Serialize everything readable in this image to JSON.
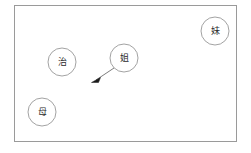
{
  "canvas": {
    "width": 251,
    "height": 153,
    "background_color": "#ffffff"
  },
  "frame": {
    "label": "diagram-frame",
    "x": 14,
    "y": 5,
    "width": 223,
    "height": 137,
    "stroke_color": "#9a9a9a",
    "fill_color": "#ffffff"
  },
  "nodes": [
    {
      "id": "node-zhi",
      "label": "治",
      "cx": 62,
      "cy": 62,
      "r": 14,
      "stroke_color": "#8a8a8a",
      "fill_color": "#ffffff",
      "text_color": "#2b2b2b"
    },
    {
      "id": "node-jie",
      "label": "姐",
      "cx": 124,
      "cy": 58,
      "r": 14,
      "stroke_color": "#8a8a8a",
      "fill_color": "#ffffff",
      "text_color": "#2b2b2b"
    },
    {
      "id": "node-mei",
      "label": "妹",
      "cx": 215,
      "cy": 31,
      "r": 14,
      "stroke_color": "#8a8a8a",
      "fill_color": "#ffffff",
      "text_color": "#2b2b2b"
    },
    {
      "id": "node-mu",
      "label": "母",
      "cx": 42,
      "cy": 112,
      "r": 14,
      "stroke_color": "#8a8a8a",
      "fill_color": "#ffffff",
      "text_color": "#2b2b2b"
    }
  ],
  "edges": [
    {
      "id": "edge-jie-to-point",
      "from": "node-jie",
      "to": "point-lower-left",
      "x1": 114,
      "y1": 68,
      "x2": 93,
      "y2": 82,
      "stroke_color": "#6e6e6e",
      "arrowhead_color": "#1a1a1a",
      "arrowhead": "filled-triangle"
    }
  ]
}
